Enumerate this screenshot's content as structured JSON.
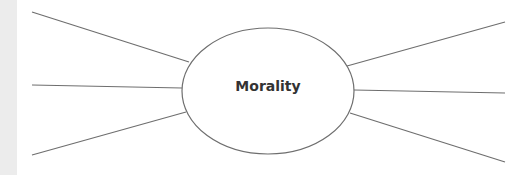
{
  "diagram": {
    "type": "spider-diagram",
    "center_label": "Morality",
    "branches": [
      {
        "side": "left",
        "position": "top",
        "label": ""
      },
      {
        "side": "left",
        "position": "middle",
        "label": ""
      },
      {
        "side": "left",
        "position": "bottom",
        "label": ""
      },
      {
        "side": "right",
        "position": "top",
        "label": ""
      },
      {
        "side": "right",
        "position": "middle",
        "label": ""
      },
      {
        "side": "right",
        "position": "bottom",
        "label": ""
      }
    ],
    "colors": {
      "line": "#6e6e6e",
      "text": "#333333",
      "background": "#ffffff",
      "left_strip": "#ececec"
    }
  }
}
